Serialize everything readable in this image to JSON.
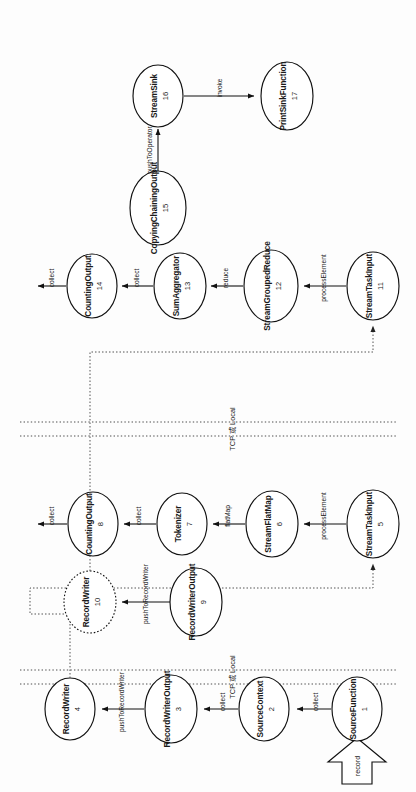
{
  "diagram": {
    "orientation": "rotated-90-clockwise",
    "input_arrow": {
      "label": "record"
    },
    "dividers": [
      {
        "id": "divider-1",
        "label": "TCP 或 Local"
      },
      {
        "id": "divider-2",
        "label": "TCP 或 Local"
      }
    ],
    "nodes": [
      {
        "id": "1",
        "label": "SourceFunction",
        "shape": "ellipse",
        "lane": 1
      },
      {
        "id": "2",
        "label": "SourceContext",
        "shape": "ellipse",
        "lane": 1
      },
      {
        "id": "3",
        "label": "RecordWriterOutput",
        "shape": "ellipse",
        "lane": 1
      },
      {
        "id": "4",
        "label": "RecordWriter",
        "shape": "ellipse",
        "lane": 1
      },
      {
        "id": "5",
        "label": "StreamTaskInput",
        "shape": "ellipse",
        "lane": 2
      },
      {
        "id": "6",
        "label": "StreamFlatMap",
        "shape": "ellipse",
        "lane": 2
      },
      {
        "id": "7",
        "label": "Tokenizer",
        "shape": "ellipse",
        "lane": 2
      },
      {
        "id": "8",
        "label": "CountingOutput",
        "shape": "ellipse",
        "lane": 2
      },
      {
        "id": "9",
        "label": "RecordWriterOutput",
        "shape": "ellipse",
        "lane": 2
      },
      {
        "id": "10",
        "label": "RecordWriter",
        "shape": "ellipse-dashed",
        "lane": 2
      },
      {
        "id": "11",
        "label": "StreamTaskInput",
        "shape": "ellipse",
        "lane": 3
      },
      {
        "id": "12",
        "label": "StreamGroupedReduce",
        "shape": "ellipse",
        "lane": 3
      },
      {
        "id": "13",
        "label": "SumAggregator",
        "shape": "ellipse",
        "lane": 3
      },
      {
        "id": "14",
        "label": "CountingOutput",
        "shape": "ellipse",
        "lane": 3
      },
      {
        "id": "15",
        "label": "CopyingChainingOutput",
        "shape": "ellipse",
        "lane": 3
      },
      {
        "id": "16",
        "label": "StreamSink",
        "shape": "ellipse",
        "lane": 3
      },
      {
        "id": "17",
        "label": "PrintSinkFunction",
        "shape": "ellipse",
        "lane": 3
      }
    ],
    "edges": [
      {
        "from": "1",
        "to": "2",
        "label": "collect",
        "style": "solid"
      },
      {
        "from": "2",
        "to": "3",
        "label": "collect",
        "style": "solid"
      },
      {
        "from": "3",
        "to": "4",
        "label": "pushToRecordWriter",
        "style": "solid"
      },
      {
        "from": "4",
        "to": "5",
        "label": "",
        "style": "dotted"
      },
      {
        "from": "5",
        "to": "6",
        "label": "processElement",
        "style": "solid"
      },
      {
        "from": "6",
        "to": "7",
        "label": "flatMap",
        "style": "solid"
      },
      {
        "from": "7",
        "to": "8",
        "label": "collect",
        "style": "solid"
      },
      {
        "from": "8",
        "to": "9",
        "label": "collect",
        "style": "solid"
      },
      {
        "from": "9",
        "to": "10",
        "label": "pushToRecordWriter",
        "style": "solid"
      },
      {
        "from": "10",
        "to": "11",
        "label": "",
        "style": "dotted"
      },
      {
        "from": "11",
        "to": "12",
        "label": "processElement",
        "style": "solid"
      },
      {
        "from": "12",
        "to": "13",
        "label": "reduce",
        "style": "solid"
      },
      {
        "from": "13",
        "to": "14",
        "label": "collect",
        "style": "solid"
      },
      {
        "from": "14",
        "to": "15",
        "label": "collect",
        "style": "solid"
      },
      {
        "from": "15",
        "to": "16",
        "label": "pushToOperator",
        "style": "solid"
      },
      {
        "from": "16",
        "to": "17",
        "label": "invoke",
        "style": "solid"
      }
    ],
    "colors": {
      "stroke": "#111111",
      "dotted_stroke": "#555555",
      "background": "#ffffff",
      "text": "#1a1a1a"
    }
  }
}
